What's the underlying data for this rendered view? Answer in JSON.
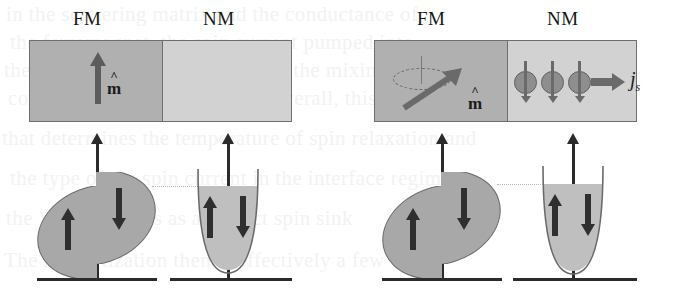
{
  "figure": {
    "type": "physics-schematic",
    "ghost_text": [
      "in the scattering matrix and the conductance of",
      "the ferromagnet, the spin current pumped into",
      "the normal metal is governed by the mixing",
      "conductance of the interface. Overall, this is the term",
      "that determines the temperature of spin relaxation and",
      "the type of the spin current in the interface regime",
      "the VM layer acts as a perfect spin sink",
      "The magnetization then is effectively a few"
    ]
  },
  "panels": [
    {
      "id": "equilibrium",
      "layers": {
        "fm_label": "FM",
        "nm_label": "NM",
        "fm_color": "#b0b0b0",
        "nm_color": "#d2d2d2",
        "magnetization_label": "m",
        "magnetization_hat": "^",
        "magnetization_direction": "up-static"
      },
      "dos": {
        "fm": {
          "shape": "ellipse",
          "spin_up_label": "up",
          "spin_down_label": "down",
          "exchange_split": true
        },
        "nm": {
          "shape": "parabola",
          "spin_up_label": "up",
          "spin_down_label": "down",
          "fill_level": "equilibrium"
        }
      }
    },
    {
      "id": "pumping",
      "layers": {
        "fm_label": "FM",
        "nm_label": "NM",
        "fm_color": "#b0b0b0",
        "nm_color": "#d2d2d2",
        "magnetization_label": "m",
        "magnetization_hat": "^",
        "magnetization_direction": "precessing-tilted",
        "precession_orbit": "dashed-ellipse",
        "spin_carriers": 3,
        "carrier_spin_direction": "down",
        "spin_current_label": "j",
        "spin_current_subscript": "s"
      },
      "dos": {
        "fm": {
          "shape": "ellipse",
          "spin_up_label": "up",
          "spin_down_label": "down",
          "exchange_split": true
        },
        "nm": {
          "shape": "parabola",
          "spin_up_label": "up",
          "spin_down_label": "down",
          "fill_level": "spin-accumulation"
        }
      }
    }
  ],
  "colors": {
    "fm_fill": "#b0b0b0",
    "nm_fill": "#d2d2d2",
    "dos_fill": "#a8a8a8",
    "nm_dos_fill": "#bfbfbf",
    "outline": "#6a6a6a",
    "axis": "#2b2b2b",
    "arrow": "#5c5c5c",
    "text": "#161616",
    "background": "#ffffff"
  }
}
